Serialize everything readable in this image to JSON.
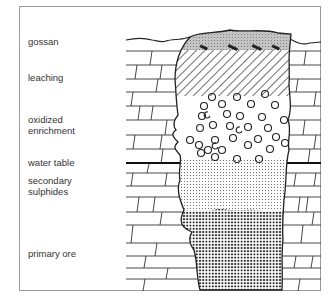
{
  "diagram": {
    "labels": [
      {
        "id": "gossan",
        "text": "gossan",
        "top": 36
      },
      {
        "id": "leaching",
        "text": "leaching",
        "top": 72
      },
      {
        "id": "oxidized-enrichment-1",
        "text": "oxidized",
        "top": 114
      },
      {
        "id": "oxidized-enrichment-2",
        "text": "enrichment",
        "top": 125
      },
      {
        "id": "water-table",
        "text": "water table",
        "top": 157
      },
      {
        "id": "secondary-sulphides-1",
        "text": "secondary",
        "top": 175
      },
      {
        "id": "secondary-sulphides-2",
        "text": "sulphides",
        "top": 186
      },
      {
        "id": "primary-ore",
        "text": "primary ore",
        "top": 248
      }
    ],
    "zones": [
      "gossan",
      "leaching",
      "oxidized enrichment",
      "water table",
      "secondary sulphides",
      "primary ore"
    ],
    "colors": {
      "line": "#222222",
      "frame": "#9a9a9a",
      "gossan_fill": "#bdbdbd"
    }
  }
}
